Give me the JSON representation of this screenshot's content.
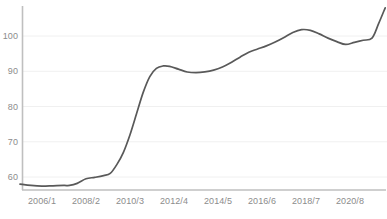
{
  "chart_data": {
    "type": "line",
    "title": "",
    "subtitle": "",
    "xlabel": "",
    "ylabel": "",
    "grid": true,
    "legend": false,
    "line_color": "#595959",
    "axis_color": "#bfbfbf",
    "grid_color": "#f0f0f0",
    "tick_label_color": "#8c8c8c",
    "ylim": [
      54,
      110
    ],
    "yticks": [
      60,
      70,
      80,
      90,
      100
    ],
    "ytick_labels": [
      "60",
      "70",
      "80",
      "90",
      "100"
    ],
    "xtick_labels": [
      "2006/1",
      "2008/2",
      "2010/3",
      "2012/4",
      "2014/5",
      "2016/6",
      "2018/7",
      "2020/8"
    ],
    "x": [
      2005.0,
      2005.5,
      2006.0,
      2006.5,
      2007.0,
      2007.25,
      2007.6,
      2008.0,
      2008.4,
      2008.8,
      2009.1,
      2009.4,
      2009.7,
      2010.0,
      2010.3,
      2010.6,
      2010.9,
      2011.2,
      2011.5,
      2011.8,
      2012.2,
      2012.6,
      2013.0,
      2013.4,
      2013.8,
      2014.2,
      2014.6,
      2015.0,
      2015.4,
      2015.8,
      2016.2,
      2016.6,
      2017.0,
      2017.4,
      2017.8,
      2018.2,
      2018.6,
      2019.0,
      2019.4,
      2019.8,
      2020.2,
      2020.6,
      2021.0,
      2021.3,
      2021.6
    ],
    "values": [
      58.0,
      57.6,
      57.4,
      57.5,
      57.6,
      57.6,
      58.2,
      59.5,
      59.9,
      60.4,
      61.0,
      63.5,
      67.0,
      72.0,
      78.0,
      84.0,
      88.5,
      90.8,
      91.5,
      91.4,
      90.6,
      89.8,
      89.6,
      89.8,
      90.3,
      91.2,
      92.5,
      94.0,
      95.4,
      96.3,
      97.2,
      98.3,
      99.6,
      101.0,
      101.8,
      101.6,
      100.6,
      99.4,
      98.4,
      97.6,
      98.2,
      98.8,
      99.4,
      103.5,
      108.0
    ]
  },
  "axis": {
    "y_axis_name": "y-axis-line",
    "x_axis_name": "x-axis-line"
  }
}
